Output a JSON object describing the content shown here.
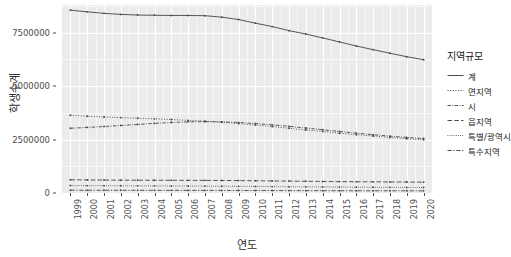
{
  "chart_data": {
    "type": "line",
    "title": "",
    "xlabel": "연도",
    "ylabel": "학생수계",
    "xlim": [
      1999,
      2020
    ],
    "ylim": [
      0,
      8800000
    ],
    "grid": true,
    "legend_position": "right",
    "legend_title": "지역규모",
    "x": [
      "1999",
      "2000",
      "2001",
      "2002",
      "2003",
      "2004",
      "2005",
      "2006",
      "2007",
      "2008",
      "2009",
      "2010",
      "2011",
      "2012",
      "2013",
      "2014",
      "2015",
      "2016",
      "2017",
      "2018",
      "2019",
      "2020"
    ],
    "ytick_labels": [
      "0",
      "2500000",
      "5000000",
      "7500000"
    ],
    "ytick_values": [
      0,
      2500000,
      5000000,
      7500000
    ],
    "series": [
      {
        "name": "계",
        "style": "solid",
        "values": [
          8560000,
          8480000,
          8410000,
          8360000,
          8330000,
          8320000,
          8310000,
          8310000,
          8300000,
          8230000,
          8120000,
          7950000,
          7790000,
          7600000,
          7440000,
          7260000,
          7070000,
          6880000,
          6710000,
          6540000,
          6380000,
          6240000
        ]
      },
      {
        "name": "면지역",
        "style": "dotted",
        "values": [
          3640000,
          3590000,
          3560000,
          3530000,
          3500000,
          3470000,
          3440000,
          3400000,
          3360000,
          3310000,
          3250000,
          3180000,
          3110000,
          3030000,
          2950000,
          2880000,
          2800000,
          2730000,
          2670000,
          2600000,
          2540000,
          2490000
        ]
      },
      {
        "name": "시",
        "style": "dashdot",
        "values": [
          3030000,
          3070000,
          3110000,
          3160000,
          3210000,
          3260000,
          3300000,
          3330000,
          3340000,
          3330000,
          3300000,
          3250000,
          3190000,
          3120000,
          3040000,
          2960000,
          2880000,
          2800000,
          2730000,
          2660000,
          2600000,
          2550000
        ]
      },
      {
        "name": "읍지역",
        "style": "longdash",
        "values": [
          620000,
          610000,
          605000,
          600000,
          598000,
          596000,
          594000,
          592000,
          590000,
          586000,
          580000,
          572000,
          564000,
          556000,
          548000,
          540000,
          533000,
          527000,
          522000,
          517000,
          512000,
          508000
        ]
      },
      {
        "name": "특별/광역시",
        "style": "finedot",
        "values": [
          350000,
          345000,
          342000,
          338000,
          335000,
          332000,
          329000,
          326000,
          322000,
          317000,
          312000,
          306000,
          300000,
          294000,
          288000,
          282000,
          277000,
          272000,
          268000,
          264000,
          260000,
          257000
        ]
      },
      {
        "name": "특수지역",
        "style": "twodash",
        "values": [
          130000,
          128000,
          127000,
          126000,
          125000,
          124000,
          123000,
          122000,
          121000,
          120000,
          118000,
          116000,
          114000,
          112000,
          110000,
          108000,
          106000,
          105000,
          104000,
          103000,
          102000,
          101000
        ]
      }
    ]
  },
  "axis": {
    "y_title": "학생수계",
    "x_title": "연도"
  },
  "legend": {
    "title": "지역규모",
    "items": [
      {
        "label": "계"
      },
      {
        "label": "면지역"
      },
      {
        "label": "시"
      },
      {
        "label": "읍지역"
      },
      {
        "label": "특별/광역시"
      },
      {
        "label": "특수지역"
      }
    ]
  },
  "colors": {
    "panel_background": "#ebebeb",
    "gridline_major": "#ffffff",
    "gridline_minor": "#f7f7f7",
    "line": "#4d4d4d",
    "text": "#1a1a1a",
    "tick_text": "#4d4d4d"
  }
}
